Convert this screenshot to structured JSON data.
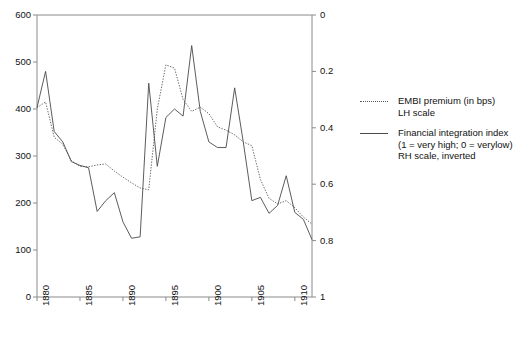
{
  "chart_data": {
    "type": "line",
    "title": "",
    "xlabel": "",
    "ylabel_left": "EMBI premium (in bps)",
    "ylabel_right": "Financial integration index",
    "xlim": [
      1880,
      1912
    ],
    "x_ticks": [
      "1880",
      "1885",
      "1890",
      "1895",
      "1900",
      "1905",
      "1910"
    ],
    "x_tick_values": [
      1880,
      1885,
      1890,
      1895,
      1900,
      1905,
      1910
    ],
    "left_axis": {
      "ticks": [
        "0",
        "100",
        "200",
        "300",
        "400",
        "500",
        "600"
      ],
      "tick_values": [
        0,
        100,
        200,
        300,
        400,
        500,
        600
      ],
      "lim": [
        0,
        600
      ],
      "inverted": false
    },
    "right_axis": {
      "ticks": [
        "0",
        "0.2",
        "0.4",
        "0.6",
        "0.8",
        "1"
      ],
      "tick_values": [
        0,
        0.2,
        0.4,
        0.6,
        0.8,
        1
      ],
      "lim": [
        0,
        1
      ],
      "inverted": true
    },
    "grid": false,
    "legend_position": "right",
    "series": [
      {
        "name": "EMBI premium (in bps) LH scale",
        "axis": "left",
        "style": "dotted",
        "color": "#5a5a5a",
        "x": [
          1880,
          1881,
          1882,
          1883,
          1884,
          1885,
          1886,
          1887,
          1888,
          1889,
          1890,
          1891,
          1892,
          1893,
          1894,
          1895,
          1896,
          1897,
          1898,
          1899,
          1900,
          1901,
          1902,
          1903,
          1904,
          1905,
          1906,
          1907,
          1908,
          1909,
          1910,
          1911,
          1912
        ],
        "values": [
          403,
          415,
          340,
          325,
          290,
          278,
          277,
          281,
          283,
          268,
          255,
          243,
          232,
          228,
          400,
          494,
          487,
          420,
          395,
          404,
          390,
          362,
          355,
          345,
          330,
          322,
          250,
          210,
          198,
          205,
          190,
          170,
          155
        ]
      },
      {
        "name": "Financial integration index (1 = very high; 0 = verylow) RH scale, inverted",
        "axis": "right",
        "style": "solid",
        "color": "#4a4a4a",
        "x": [
          1880,
          1881,
          1882,
          1883,
          1884,
          1885,
          1886,
          1887,
          1888,
          1889,
          1890,
          1891,
          1892,
          1893,
          1894,
          1895,
          1896,
          1897,
          1898,
          1899,
          1900,
          1901,
          1902,
          1903,
          1904,
          1905,
          1906,
          1907,
          1908,
          1909,
          1910,
          1911,
          1912
        ],
        "values_left_equiv": [
          403,
          480,
          352,
          330,
          288,
          280,
          275,
          182,
          205,
          222,
          160,
          125,
          128,
          455,
          278,
          382,
          400,
          385,
          535,
          395,
          330,
          318,
          318,
          445,
          330,
          205,
          212,
          178,
          195,
          258,
          180,
          165,
          122
        ]
      }
    ],
    "legend": [
      {
        "key": "dotted",
        "lines": [
          "EMBI premium (in bps)",
          "LH scale"
        ]
      },
      {
        "key": "solid",
        "lines": [
          "Financial integration index",
          "(1 = very high; 0 = verylow)",
          "RH scale, inverted"
        ]
      }
    ]
  }
}
